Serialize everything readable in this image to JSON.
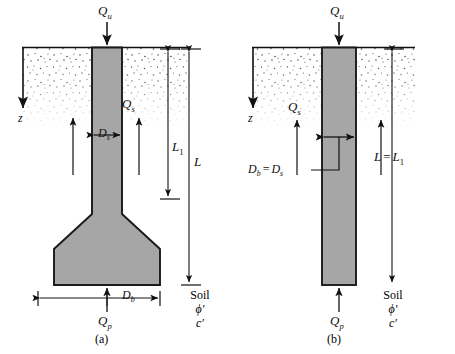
{
  "figure": {
    "background": "#ffffff",
    "ink": "#111111",
    "concrete_fill": "#a6a6a6",
    "concrete_stroke": "#1a1a1a",
    "soil_stipple": "#3a3a3a"
  },
  "panels": [
    {
      "id": "a",
      "caption": "(a)",
      "type": "belled-drilled-shaft",
      "labels": {
        "applied_load": "Q",
        "applied_load_sub": "u",
        "skin_friction": "Q",
        "skin_friction_sub": "s",
        "point_load": "Q",
        "point_load_sub": "p",
        "shaft_diameter": "D",
        "shaft_diameter_sub": "s",
        "base_diameter": "D",
        "base_diameter_sub": "b",
        "depth_axis": "z",
        "length_shaft": "L",
        "length_shaft_sub": "1",
        "length_total": "L"
      },
      "soil_note": {
        "material": "Soil",
        "friction_angle": "ϕ′",
        "cohesion": "c′"
      }
    },
    {
      "id": "b",
      "caption": "(b)",
      "type": "straight-drilled-shaft",
      "labels": {
        "applied_load": "Q",
        "applied_load_sub": "u",
        "skin_friction": "Q",
        "skin_friction_sub": "s",
        "point_load": "Q",
        "point_load_sub": "p",
        "diameter_relation_left": "D",
        "diameter_relation_left_sub": "b",
        "diameter_relation_eq": "=",
        "diameter_relation_right": "D",
        "diameter_relation_right_sub": "s",
        "depth_axis": "z",
        "length_relation_left": "L",
        "length_relation_eq": "=",
        "length_relation_right": "L",
        "length_relation_right_sub": "1"
      },
      "soil_note": {
        "material": "Soil",
        "friction_angle": "ϕ′",
        "cohesion": "c′"
      }
    }
  ]
}
